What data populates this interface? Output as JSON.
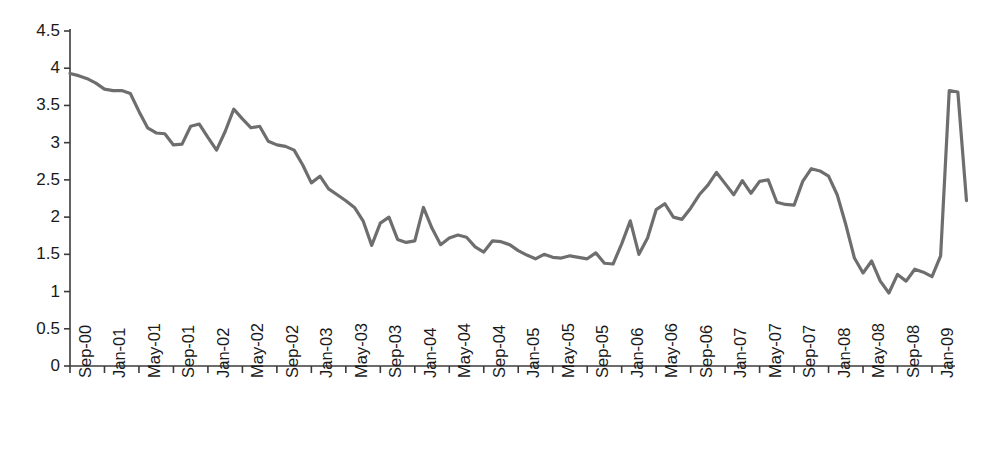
{
  "chart_data": {
    "type": "line",
    "title": "",
    "subtitle": "",
    "xlabel": "",
    "ylabel": "",
    "ylim": [
      0,
      4.5
    ],
    "ytick_step": 0.5,
    "ytick_labels": [
      "0",
      "0.5",
      "1",
      "1.5",
      "2",
      "2.5",
      "3",
      "3.5",
      "4",
      "4.5"
    ],
    "ytick_values": [
      0,
      0.5,
      1,
      1.5,
      2,
      2.5,
      3,
      3.5,
      4,
      4.5
    ],
    "grid": false,
    "legend": "none",
    "line_color": "#6e6e6e",
    "axis_color": "#3b3b3b",
    "x_tick_interval_months": 4,
    "xtick_labels": [
      "Sep-00",
      "Jan-01",
      "May-01",
      "Sep-01",
      "Jan-02",
      "May-02",
      "Sep-02",
      "Jan-03",
      "May-03",
      "Sep-03",
      "Jan-04",
      "May-04",
      "Sep-04",
      "Jan-05",
      "May-05",
      "Sep-05",
      "Jan-06",
      "May-06",
      "Sep-06",
      "Jan-07",
      "May-07",
      "Sep-07",
      "Jan-08",
      "May-08",
      "Sep-08",
      "Jan-09"
    ],
    "x": [
      "Sep-00",
      "Oct-00",
      "Nov-00",
      "Dec-00",
      "Jan-01",
      "Feb-01",
      "Mar-01",
      "Apr-01",
      "May-01",
      "Jun-01",
      "Jul-01",
      "Aug-01",
      "Sep-01",
      "Oct-01",
      "Nov-01",
      "Dec-01",
      "Jan-02",
      "Feb-02",
      "Mar-02",
      "Apr-02",
      "May-02",
      "Jun-02",
      "Jul-02",
      "Aug-02",
      "Sep-02",
      "Oct-02",
      "Nov-02",
      "Dec-02",
      "Jan-03",
      "Feb-03",
      "Mar-03",
      "Apr-03",
      "May-03",
      "Jun-03",
      "Jul-03",
      "Aug-03",
      "Sep-03",
      "Oct-03",
      "Nov-03",
      "Dec-03",
      "Jan-04",
      "Feb-04",
      "Mar-04",
      "Apr-04",
      "May-04",
      "Jun-04",
      "Jul-04",
      "Aug-04",
      "Sep-04",
      "Oct-04",
      "Nov-04",
      "Dec-04",
      "Jan-05",
      "Feb-05",
      "Mar-05",
      "Apr-05",
      "May-05",
      "Jun-05",
      "Jul-05",
      "Aug-05",
      "Sep-05",
      "Oct-05",
      "Nov-05",
      "Dec-05",
      "Jan-06",
      "Feb-06",
      "Mar-06",
      "Apr-06",
      "May-06",
      "Jun-06",
      "Jul-06",
      "Aug-06",
      "Sep-06",
      "Oct-06",
      "Nov-06",
      "Dec-06",
      "Jan-07",
      "Feb-07",
      "Mar-07",
      "Apr-07",
      "May-07",
      "Jun-07",
      "Jul-07",
      "Aug-07",
      "Sep-07",
      "Oct-07",
      "Nov-07",
      "Dec-07",
      "Jan-08",
      "Feb-08",
      "Mar-08",
      "Apr-08",
      "May-08",
      "Jun-08",
      "Jul-08",
      "Aug-08",
      "Sep-08",
      "Oct-08",
      "Nov-08",
      "Dec-08",
      "Jan-09",
      "Feb-09",
      "Mar-09",
      "Apr-09",
      "May-09"
    ],
    "values": [
      3.93,
      3.9,
      3.86,
      3.8,
      3.72,
      3.7,
      3.7,
      3.66,
      3.42,
      3.2,
      3.13,
      3.12,
      2.97,
      2.98,
      3.22,
      3.25,
      3.07,
      2.9,
      3.15,
      3.45,
      3.32,
      3.2,
      3.22,
      3.02,
      2.97,
      2.95,
      2.9,
      2.7,
      2.46,
      2.55,
      2.38,
      2.3,
      2.22,
      2.13,
      1.95,
      1.62,
      1.92,
      2.0,
      1.7,
      1.66,
      1.68,
      2.13,
      1.85,
      1.63,
      1.72,
      1.76,
      1.73,
      1.6,
      1.53,
      1.68,
      1.67,
      1.63,
      1.55,
      1.49,
      1.44,
      1.5,
      1.46,
      1.45,
      1.48,
      1.46,
      1.44,
      1.52,
      1.38,
      1.37,
      1.64,
      1.95,
      1.5,
      1.72,
      2.1,
      2.18,
      2.0,
      1.97,
      2.12,
      2.3,
      2.43,
      2.6,
      2.45,
      2.3,
      2.49,
      2.32,
      2.48,
      2.5,
      2.2,
      2.17,
      2.16,
      2.48,
      2.65,
      2.62,
      2.55,
      2.3,
      1.9,
      1.45,
      1.25,
      1.41,
      1.14,
      0.98,
      1.23,
      1.14,
      1.3,
      1.26,
      1.2,
      1.48,
      3.7,
      3.68,
      2.22
    ]
  }
}
